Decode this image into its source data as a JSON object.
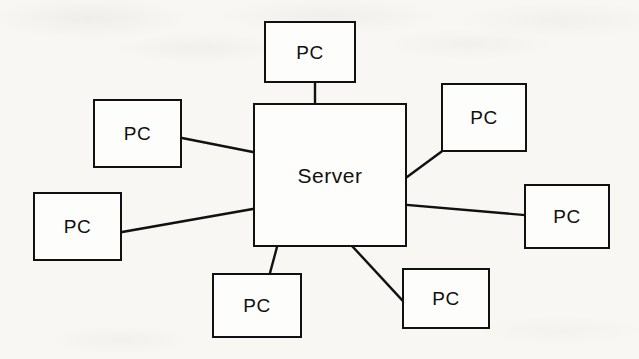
{
  "diagram": {
    "type": "network-topology",
    "background_color": "#f8f7f4",
    "line_color": "#111111",
    "node_fill": "#fdfdfb",
    "server": {
      "label": "Server",
      "x": 253,
      "y": 103,
      "width": 154,
      "height": 144
    },
    "clients": [
      {
        "id": "pc-top",
        "label": "PC",
        "x": 264,
        "y": 21,
        "width": 92,
        "height": 62
      },
      {
        "id": "pc-upper-left",
        "label": "PC",
        "x": 93,
        "y": 99,
        "width": 89,
        "height": 69
      },
      {
        "id": "pc-upper-right",
        "label": "PC",
        "x": 441,
        "y": 83,
        "width": 86,
        "height": 69
      },
      {
        "id": "pc-left",
        "label": "PC",
        "x": 33,
        "y": 192,
        "width": 89,
        "height": 69
      },
      {
        "id": "pc-right",
        "label": "PC",
        "x": 524,
        "y": 184,
        "width": 86,
        "height": 65
      },
      {
        "id": "pc-bottom-left",
        "label": "PC",
        "x": 212,
        "y": 273,
        "width": 90,
        "height": 65
      },
      {
        "id": "pc-bottom-right",
        "label": "PC",
        "x": 402,
        "y": 268,
        "width": 88,
        "height": 61
      }
    ],
    "links": [
      {
        "id": "link-top",
        "from": "pc-top",
        "to": "server",
        "x1": 315,
        "y1": 83,
        "x2": 315,
        "y2": 103
      },
      {
        "id": "link-upper-left",
        "from": "pc-upper-left",
        "to": "server",
        "x1": 182,
        "y1": 138,
        "x2": 253,
        "y2": 152
      },
      {
        "id": "link-upper-right",
        "from": "pc-upper-right",
        "to": "server",
        "x1": 441,
        "y1": 152,
        "x2": 407,
        "y2": 177
      },
      {
        "id": "link-left",
        "from": "pc-left",
        "to": "server",
        "x1": 122,
        "y1": 232,
        "x2": 253,
        "y2": 209
      },
      {
        "id": "link-right",
        "from": "pc-right",
        "to": "server",
        "x1": 407,
        "y1": 205,
        "x2": 524,
        "y2": 215
      },
      {
        "id": "link-bottom-left",
        "from": "pc-bottom-left",
        "to": "server",
        "x1": 277,
        "y1": 247,
        "x2": 270,
        "y2": 273
      },
      {
        "id": "link-bottom-right",
        "from": "pc-bottom-right",
        "to": "server",
        "x1": 353,
        "y1": 247,
        "x2": 402,
        "y2": 300
      }
    ]
  }
}
